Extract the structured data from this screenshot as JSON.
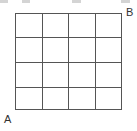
{
  "diagram": {
    "type": "grid",
    "rows": 4,
    "columns": 4,
    "line_color": "#555555",
    "labels": {
      "bottom_left": "A",
      "top_right": "B"
    }
  }
}
